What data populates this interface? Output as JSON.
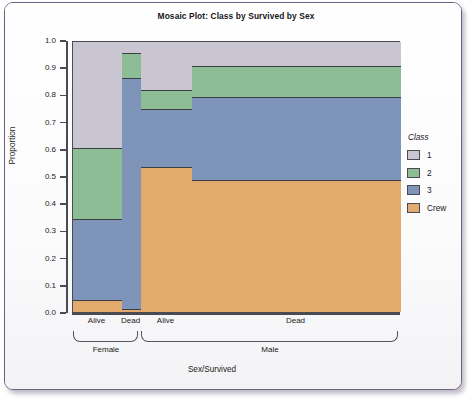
{
  "chart_data": {
    "type": "bar",
    "subtype": "mosaic",
    "title": "Mosaic Plot: Class by Survived by Sex",
    "xlabel": "Sex/Survived",
    "ylabel": "Proportion",
    "ylim": [
      0.0,
      1.0
    ],
    "ytick_labels": [
      "1.0",
      "0.9",
      "0.8",
      "0.7",
      "0.6",
      "0.5",
      "0.4",
      "0.3",
      "0.2",
      "0.1",
      "0.0"
    ],
    "ytick_values": [
      1.0,
      0.9,
      0.8,
      0.7,
      0.6,
      0.5,
      0.4,
      0.3,
      0.2,
      0.1,
      0.0
    ],
    "grid": false,
    "legend": {
      "title": "Class",
      "position": "right",
      "entries": [
        {
          "label": "1",
          "color": "#c9c6d1"
        },
        {
          "label": "2",
          "color": "#8cbd94"
        },
        {
          "label": "3",
          "color": "#7f94b9"
        },
        {
          "label": "Crew",
          "color": "#e2aa6d"
        }
      ]
    },
    "groups": [
      {
        "label": "Female",
        "width_frac": 0.2073
      },
      {
        "label": "Male",
        "width_frac": 0.7927
      }
    ],
    "categories": [
      "Alive",
      "Dead",
      "Alive",
      "Dead"
    ],
    "columns": [
      {
        "group": "Female",
        "survived": "Alive",
        "x_start_frac": 0.0,
        "width_frac": 0.1494,
        "segments": [
          {
            "class": "1",
            "from": 0.612,
            "to": 1.0,
            "proportion": 0.388
          },
          {
            "class": "2",
            "from": 0.348,
            "to": 0.612,
            "proportion": 0.264
          },
          {
            "class": "3",
            "from": 0.053,
            "to": 0.348,
            "proportion": 0.295
          },
          {
            "class": "Crew",
            "from": 0.0,
            "to": 0.053,
            "proportion": 0.053
          }
        ]
      },
      {
        "group": "Female",
        "survived": "Dead",
        "x_start_frac": 0.1494,
        "width_frac": 0.0579,
        "segments": [
          {
            "class": "1",
            "from": 0.96,
            "to": 1.0,
            "proportion": 0.04
          },
          {
            "class": "2",
            "from": 0.868,
            "to": 0.96,
            "proportion": 0.092
          },
          {
            "class": "3",
            "from": 0.02,
            "to": 0.868,
            "proportion": 0.848
          },
          {
            "class": "Crew",
            "from": 0.0,
            "to": 0.02,
            "proportion": 0.02
          }
        ]
      },
      {
        "group": "Male",
        "survived": "Alive",
        "x_start_frac": 0.2073,
        "width_frac": 0.1555,
        "segments": [
          {
            "class": "1",
            "from": 0.825,
            "to": 1.0,
            "proportion": 0.175
          },
          {
            "class": "2",
            "from": 0.755,
            "to": 0.825,
            "proportion": 0.07
          },
          {
            "class": "3",
            "from": 0.541,
            "to": 0.755,
            "proportion": 0.214
          },
          {
            "class": "Crew",
            "from": 0.0,
            "to": 0.541,
            "proportion": 0.541
          }
        ]
      },
      {
        "group": "Male",
        "survived": "Dead",
        "x_start_frac": 0.3628,
        "width_frac": 0.6372,
        "segments": [
          {
            "class": "1",
            "from": 0.913,
            "to": 1.0,
            "proportion": 0.087
          },
          {
            "class": "2",
            "from": 0.798,
            "to": 0.913,
            "proportion": 0.115
          },
          {
            "class": "3",
            "from": 0.494,
            "to": 0.798,
            "proportion": 0.304
          },
          {
            "class": "Crew",
            "from": 0.0,
            "to": 0.494,
            "proportion": 0.494
          }
        ]
      }
    ]
  }
}
